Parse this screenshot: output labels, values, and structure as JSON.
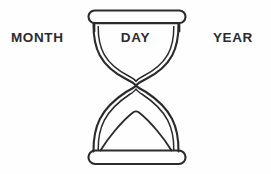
{
  "graphic": {
    "name": "hourglass-date-diagram",
    "background_color": "#fefefe",
    "stroke_color": "#2b2b2e",
    "text_color": "#2b2b2e",
    "labels": {
      "left": "MONTH",
      "center": "DAY",
      "right": "YEAR"
    },
    "icon": {
      "semantic_name": "hourglass-icon",
      "style": "line-art outline",
      "parts": [
        "top-cap",
        "top-inner-rim",
        "upper-bulb",
        "neck",
        "lower-bulb",
        "sand-mound",
        "bottom-cap"
      ]
    }
  }
}
